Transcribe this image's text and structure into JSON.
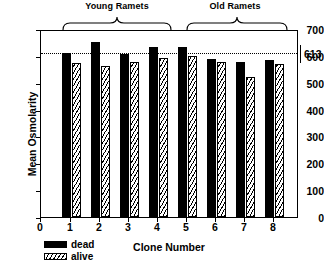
{
  "chart_data": {
    "type": "bar",
    "title": "",
    "xlabel": "Clone Number",
    "ylabel": "Mean Osmolarity",
    "categories": [
      "1",
      "2",
      "3",
      "4",
      "5",
      "6",
      "7",
      "8"
    ],
    "x_tick_labels": [
      "0",
      "1",
      "2",
      "3",
      "4",
      "5",
      "6",
      "7",
      "8"
    ],
    "y_tick_labels": [
      "0",
      "100",
      "200",
      "300",
      "400",
      "500",
      "600",
      "700"
    ],
    "ylim": [
      0,
      700
    ],
    "xlim": [
      0,
      8.6
    ],
    "grid": false,
    "legend_position": "below-left",
    "series": [
      {
        "name": "dead",
        "values": [
          617,
          657,
          612,
          640,
          640,
          596,
          582,
          592
        ]
      },
      {
        "name": "alive",
        "values": [
          580,
          568,
          582,
          599,
          607,
          585,
          528,
          576
        ]
      }
    ],
    "reference_line": {
      "value": 613,
      "label": "613",
      "style": "dotted"
    },
    "group_brackets": [
      {
        "label": "Young Ramets",
        "from": "1",
        "to": "4"
      },
      {
        "label": "Old Ramets",
        "from": "5",
        "to": "8"
      }
    ],
    "colors": {
      "dead": "#000000",
      "alive": "#ffffff",
      "axis": "#000000",
      "reference_line": "#000000"
    }
  },
  "legend": {
    "items": [
      {
        "label": "dead"
      },
      {
        "label": "alive"
      }
    ]
  }
}
